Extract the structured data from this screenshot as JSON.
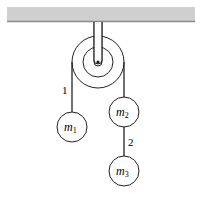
{
  "diagram": {
    "type": "pulley-system",
    "colors": {
      "ceiling_fill": "#cfcfcf",
      "ceiling_edge": "#8a8a8a",
      "stroke": "#222222",
      "background": "#ffffff"
    },
    "ceiling": {
      "x": 7,
      "y": 7,
      "width": 188,
      "height": 14
    },
    "pulley": {
      "cx": 98,
      "cy": 62,
      "outer_r": 26,
      "inner_r": 15,
      "axle_r": 1.6
    },
    "ropes": [
      {
        "id": "rope-1",
        "label": "1",
        "label_x": 62,
        "label_y": 94
      },
      {
        "id": "rope-2",
        "label": "2",
        "label_x": 128,
        "label_y": 146
      }
    ],
    "masses": [
      {
        "id": "m1",
        "symbol": "m",
        "subscript": "1",
        "cx": 72,
        "cy": 127,
        "r": 15
      },
      {
        "id": "m2",
        "symbol": "m",
        "subscript": "2",
        "cx": 124,
        "cy": 112,
        "r": 15
      },
      {
        "id": "m3",
        "symbol": "m",
        "subscript": "3",
        "cx": 124,
        "cy": 171,
        "r": 15
      }
    ]
  }
}
